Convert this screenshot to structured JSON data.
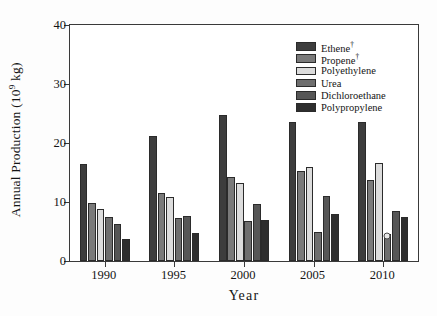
{
  "chart_data": {
    "type": "bar",
    "title": "",
    "subtitle": "",
    "xlabel": "Year",
    "ylabel": "Annual Production (10^9 kg)",
    "ylabel_base": "Annual Production (10",
    "ylabel_exp": "9",
    "ylabel_tail": " kg)",
    "categories": [
      "1990",
      "1995",
      "2000",
      "2005",
      "2010"
    ],
    "ylim": [
      0,
      40
    ],
    "yticks": [
      0,
      10,
      20,
      30,
      40
    ],
    "ytick_labels": [
      "0",
      "10",
      "20",
      "30",
      "40"
    ],
    "grid": false,
    "legend_position": "top-right",
    "series": [
      {
        "name": "Ethene",
        "name_sup": "†",
        "color": "#3d3d3d",
        "values": [
          16.4,
          21.2,
          24.8,
          23.6,
          23.5
        ]
      },
      {
        "name": "Propene",
        "name_sup": "†",
        "color": "#7a7a7a",
        "values": [
          9.9,
          11.5,
          14.2,
          15.2,
          13.8
        ]
      },
      {
        "name": "Polyethylene",
        "name_sup": "",
        "color": "#dcdcdc",
        "values": [
          8.8,
          10.8,
          13.2,
          16.0,
          16.6
        ]
      },
      {
        "name": "Urea",
        "name_sup": "",
        "color": "#6e6e6e",
        "values": [
          7.4,
          7.3,
          6.8,
          4.9,
          4.6
        ]
      },
      {
        "name": "Dichloroethane",
        "name_sup": "",
        "color": "#565656",
        "values": [
          6.2,
          7.7,
          9.7,
          11.0,
          8.4
        ]
      },
      {
        "name": "Polypropylene",
        "name_sup": "",
        "color": "#2e2e2e",
        "values": [
          3.7,
          4.7,
          6.9,
          7.9,
          7.4
        ]
      }
    ],
    "annotations": [
      {
        "text": "*",
        "series": "Urea",
        "category": "2010",
        "value": 4.6,
        "note": "asterisk marker at top of 2010 Urea bar"
      }
    ]
  },
  "axes": {
    "frame_color": "#3a3a3a"
  }
}
